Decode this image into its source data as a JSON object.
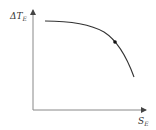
{
  "diagram": {
    "type": "curve-sketch",
    "y_axis": {
      "label_prefix": "ΔT",
      "label_subscript": "E"
    },
    "x_axis": {
      "label_prefix": "S",
      "label_subscript": "E"
    },
    "curve": {
      "description": "Concave-down decreasing curve: nearly flat at left, falling steeply at right",
      "marked_point": true
    },
    "colors": {
      "axis": "#888888",
      "curve": "#333333",
      "point": "#111111",
      "text": "#333333"
    }
  }
}
